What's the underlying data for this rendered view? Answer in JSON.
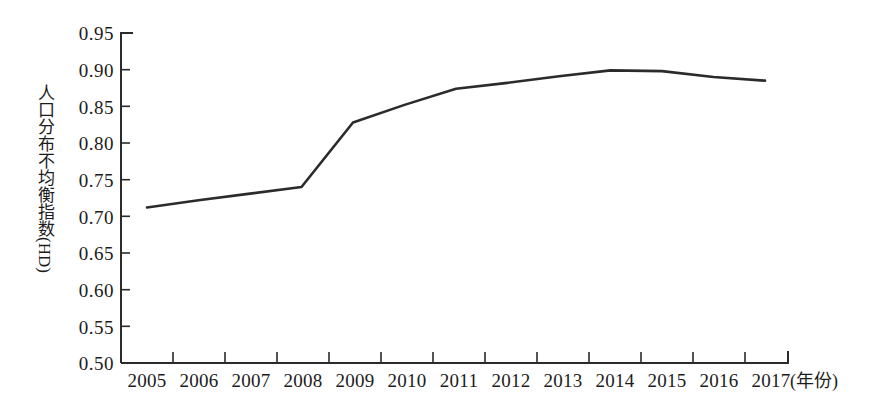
{
  "chart_data": {
    "type": "line",
    "title": "",
    "xlabel": "(年份)",
    "ylabel": "人口分布不均衡指数(HD)",
    "ylabel_cjk": "人口分布不均衡指数",
    "ylabel_latin": "(HD)",
    "categories": [
      "2005",
      "2006",
      "2007",
      "2008",
      "2009",
      "2010",
      "2011",
      "2012",
      "2013",
      "2014",
      "2015",
      "2016",
      "2017"
    ],
    "values": [
      0.712,
      0.722,
      0.731,
      0.74,
      0.828,
      0.852,
      0.874,
      0.882,
      0.891,
      0.899,
      0.898,
      0.89,
      0.885
    ],
    "series": [
      {
        "name": "人口分布不均衡指数(HD)",
        "values": [
          0.712,
          0.722,
          0.731,
          0.74,
          0.828,
          0.852,
          0.874,
          0.882,
          0.891,
          0.899,
          0.898,
          0.89,
          0.885
        ]
      }
    ],
    "ylim": [
      0.5,
      0.95
    ],
    "ytick_labels": [
      "0.95",
      "0.90",
      "0.85",
      "0.80",
      "0.75",
      "0.70",
      "0.65",
      "0.60",
      "0.55",
      "0.50"
    ],
    "ytick_values": [
      0.95,
      0.9,
      0.85,
      0.8,
      0.75,
      0.7,
      0.65,
      0.6,
      0.55,
      0.5
    ],
    "ytick_step": 0.05,
    "grid": false,
    "legend": false,
    "legend_position": "none",
    "line_color": "#2b2b2b",
    "axis_color": "#2b2b2b"
  }
}
